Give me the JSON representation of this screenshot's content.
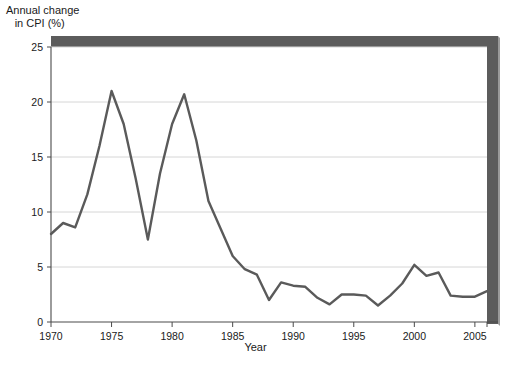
{
  "chart_data": {
    "type": "line",
    "title": "Annual change in CPI (%)",
    "title_line1": "Annual change",
    "title_line2": "in CPI (%)",
    "xlabel": "Year",
    "ylabel": "",
    "xlim": [
      1970,
      2006
    ],
    "ylim": [
      0,
      25
    ],
    "yticks": [
      0,
      5,
      10,
      15,
      20,
      25
    ],
    "ytick_labels": [
      "0",
      "5",
      "10",
      "15",
      "20",
      "25"
    ],
    "xticks": [
      1970,
      1975,
      1980,
      1985,
      1990,
      1995,
      2000,
      2005
    ],
    "xtick_labels": [
      "1970",
      "1975",
      "1980",
      "1985",
      "1990",
      "1995",
      "2000",
      "2005"
    ],
    "grid": "horizontal",
    "legend": "none",
    "line_color": "#5a5a5a",
    "grid_color": "#d6d6d6",
    "axis_color": "#4a4a4a",
    "frame_color": "#5c5c5c",
    "x": [
      1970,
      1971,
      1972,
      1973,
      1974,
      1975,
      1976,
      1977,
      1978,
      1979,
      1980,
      1981,
      1982,
      1983,
      1984,
      1985,
      1986,
      1987,
      1988,
      1989,
      1990,
      1991,
      1992,
      1993,
      1994,
      1995,
      1996,
      1997,
      1998,
      1999,
      2000,
      2001,
      2002,
      2003,
      2004,
      2005,
      2006
    ],
    "values": [
      8.0,
      9.0,
      8.6,
      11.6,
      16.0,
      21.0,
      18.0,
      13.0,
      7.5,
      13.5,
      18.0,
      20.7,
      16.5,
      11.0,
      8.5,
      6.0,
      4.8,
      4.3,
      2.0,
      3.6,
      3.3,
      3.2,
      2.2,
      1.6,
      2.5,
      2.5,
      2.4,
      1.5,
      2.4,
      3.5,
      5.2,
      4.2,
      4.5,
      2.4,
      2.3,
      2.3,
      2.8
    ]
  },
  "axes": {
    "x_axis_title": "Year",
    "y_axis_title": ""
  }
}
